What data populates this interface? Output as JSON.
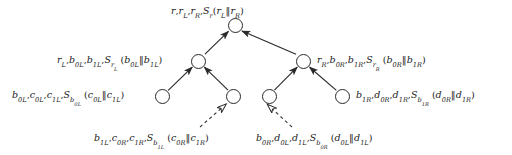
{
  "diagram": {
    "type": "authenticated-hash-tree",
    "title": "",
    "nodes": [
      {
        "id": "root",
        "cx": 235,
        "cy": 25,
        "r": 7.5
      },
      {
        "id": "mid-left",
        "cx": 198,
        "cy": 61,
        "r": 7.5
      },
      {
        "id": "mid-right",
        "cx": 303,
        "cy": 61,
        "r": 7.5
      },
      {
        "id": "leaf-1",
        "cx": 162,
        "cy": 96,
        "r": 7.5
      },
      {
        "id": "leaf-2",
        "cx": 233,
        "cy": 96,
        "r": 7.5
      },
      {
        "id": "leaf-3",
        "cx": 269,
        "cy": 96,
        "r": 7.5
      },
      {
        "id": "leaf-4",
        "cx": 342,
        "cy": 96,
        "r": 7.5
      }
    ],
    "edges": [
      {
        "from": "mid-left",
        "to": "root",
        "style": "solid",
        "arrow": "filled"
      },
      {
        "from": "mid-right",
        "to": "root",
        "style": "solid",
        "arrow": "filled"
      },
      {
        "from": "leaf-1",
        "to": "mid-left",
        "style": "solid",
        "arrow": "filled"
      },
      {
        "from": "leaf-2",
        "to": "mid-left",
        "style": "solid",
        "arrow": "filled"
      },
      {
        "from": "leaf-3",
        "to": "mid-right",
        "style": "solid",
        "arrow": "filled"
      },
      {
        "from": "leaf-4",
        "to": "mid-right",
        "style": "solid",
        "arrow": "filled"
      }
    ],
    "callouts": [
      {
        "id": "callout-left",
        "target": "leaf-2",
        "style": "dashed",
        "arrow": "hollow"
      },
      {
        "id": "callout-right",
        "target": "leaf-3",
        "style": "dashed",
        "arrow": "hollow"
      }
    ],
    "colors": {
      "stroke": "#2a2a2a",
      "text": "#1a1a1a",
      "background": "#ffffff",
      "dashed_stroke": "#3a3a3a"
    }
  },
  "labels": {
    "root": {
      "plain": "r, rL, rR, Sr(rL‖rR)",
      "terms": [
        "r",
        "r_L",
        "r_R",
        "S_r(r_L ‖ r_R)"
      ]
    },
    "mid_left": {
      "plain": "rL, b0L, b1L, SrL(b0L‖b1L)",
      "terms": [
        "r_L",
        "b_0L",
        "b_1L",
        "S_{r_L}(b_0L ‖ b_1L)"
      ]
    },
    "mid_right": {
      "plain": "rR, b0R, b1R, SrR(b0R‖b1R)",
      "terms": [
        "r_R",
        "b_0R",
        "b_1R",
        "S_{r_R}(b_0R ‖ b_1R)"
      ]
    },
    "leaf_1": {
      "plain": "b0L, c0L, c1L, Sb0L(c0L‖c1L)",
      "terms": [
        "b_0L",
        "c_0L",
        "c_1L",
        "S_{b_0L}(c_0L ‖ c_1L)"
      ]
    },
    "leaf_4": {
      "plain": "b1R, d0R, d1R, Sb1R(d0R‖d1R)",
      "terms": [
        "b_1R",
        "d_0R",
        "d_1R",
        "S_{b_1R}(d_0R ‖ d_1R)"
      ]
    },
    "callout_left": {
      "plain": "b1L, c0R, c1R, Sb1L(c0R‖c1R)",
      "terms": [
        "b_1L",
        "c_0R",
        "c_1R",
        "S_{b_1L}(c_0R ‖ c_1R)"
      ]
    },
    "callout_right": {
      "plain": "b0R, d0L, d1L, Sb0R(d0L‖d1L)",
      "terms": [
        "b_0R",
        "d_0L",
        "d_1L",
        "S_{b_0R}(d_0L ‖ d_1L)"
      ]
    }
  }
}
